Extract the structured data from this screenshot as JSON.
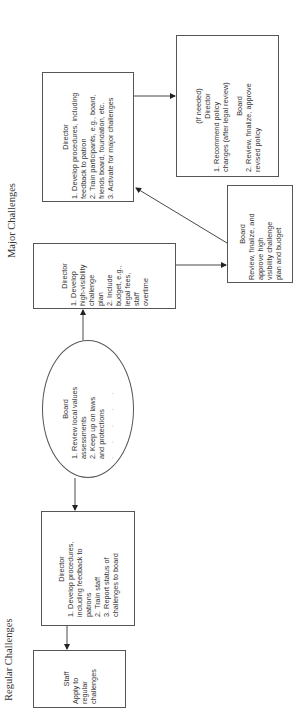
{
  "diagram": {
    "orientation": "rotated -90 degrees (text reads bottom to top)",
    "sections": {
      "major": {
        "label": "Major Challenges"
      },
      "regular": {
        "label": "Regular Challenges"
      }
    },
    "nodes": {
      "director_major": {
        "title": "Director",
        "items": [
          "1. Develop procedures, including",
          "feedback to patron",
          "2. Train participants, e.g., board,",
          "friends board, foundation, etc.",
          "3. Activate for major challenges"
        ]
      },
      "policy": {
        "note": "(If needed)",
        "director_title": "Director",
        "director_items": [
          "1. Recommend policy",
          "changes (after legal review)"
        ],
        "board_title": "Board",
        "board_items": [
          "2. Review, finalize, approve",
          "revised policy"
        ]
      },
      "director_budget": {
        "title": "Director",
        "items": [
          "1. Develop",
          "high-visibility",
          "challenge",
          "plan",
          "2. Include",
          "budget, e.g.,",
          "legal fees,",
          "staff",
          "overtime"
        ]
      },
      "board_approve": {
        "title": "Board",
        "items": [
          "Review, finalize, and",
          "approve high",
          "visibility challenge",
          "plan and budget"
        ]
      },
      "board_values": {
        "title": "Board",
        "items": [
          "1. Review local values",
          "assessments",
          "2. Keep up on laws",
          "and protections"
        ],
        "trailing": ". . . . ."
      },
      "director_regular": {
        "title": "Director",
        "items": [
          "1. Develop procedures,",
          "including feedback to",
          "patrons",
          "2. Train staff",
          "3. Report status of",
          "challenges to board"
        ]
      },
      "staff": {
        "title": "Staff",
        "items": [
          "Apply to",
          "regular",
          "challenges"
        ]
      }
    },
    "edges": [
      {
        "from": "board_values",
        "to": "director_budget"
      },
      {
        "from": "board_values",
        "to": "director_regular"
      },
      {
        "from": "director_budget",
        "to": "board_approve"
      },
      {
        "from": "board_approve",
        "to": "director_major"
      },
      {
        "from": "director_major",
        "to": "policy"
      },
      {
        "from": "director_regular",
        "to": "staff"
      }
    ],
    "colors": {
      "line": "#333333",
      "border": "#555555",
      "text": "#333333",
      "background": "#ffffff"
    }
  }
}
